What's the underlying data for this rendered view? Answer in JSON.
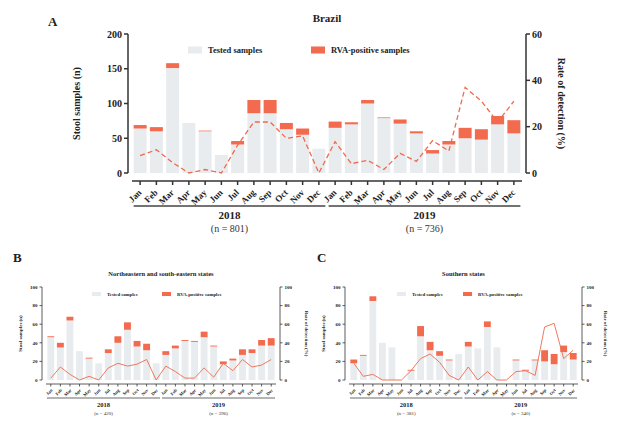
{
  "colors": {
    "tested": "#e9ecef",
    "positive": "#f26b4f",
    "rate_line": "#ee6a4c",
    "axis": "#333333"
  },
  "chart_data": [
    {
      "panel": "A",
      "type": "bar",
      "title": "Brazil",
      "xlabel": "",
      "ylabel": "Stool samples (n)",
      "y2label": "Rate of detection (%)",
      "ylim": [
        0,
        200
      ],
      "y2lim": [
        0,
        60
      ],
      "yticks": [
        0,
        50,
        100,
        150,
        200
      ],
      "y2ticks": [
        0,
        20,
        40,
        60
      ],
      "legend": [
        "Tested samples",
        "RVA-positive samples"
      ],
      "legend_position": "top",
      "grid": false,
      "categories": [
        "Jan",
        "Feb",
        "Mar",
        "Apr",
        "May",
        "Jun",
        "Jul",
        "Aug",
        "Sep",
        "Oct",
        "Nov",
        "Dec",
        "Jan",
        "Feb",
        "Mar",
        "Apr",
        "May",
        "Jun",
        "Jul",
        "Aug",
        "Sep",
        "Oct",
        "Nov",
        "Dec"
      ],
      "groups": [
        {
          "label": "2018",
          "n_label": "(n = 801)"
        },
        {
          "label": "2019",
          "n_label": "(n = 736)"
        }
      ],
      "series": [
        {
          "name": "Tested samples",
          "values": [
            64,
            60,
            151,
            72,
            60,
            26,
            41,
            86,
            86,
            63,
            55,
            35,
            65,
            70,
            100,
            79,
            71,
            57,
            28,
            41,
            50,
            48,
            70,
            57
          ]
        },
        {
          "name": "RVA-positive samples",
          "values": [
            5,
            6,
            7,
            0,
            1,
            0,
            5,
            19,
            19,
            9,
            9,
            0,
            9,
            3,
            5,
            1,
            6,
            3,
            5,
            5,
            15,
            15,
            12,
            19
          ]
        },
        {
          "name": "Rate of detection (%)",
          "axis": "right",
          "values": [
            7.5,
            10,
            4.5,
            0,
            1.5,
            0,
            12,
            22,
            22,
            15,
            16,
            0,
            13.5,
            4,
            5.5,
            1.5,
            8.5,
            5,
            14,
            9.5,
            37,
            31,
            22,
            31
          ]
        }
      ]
    },
    {
      "panel": "B",
      "type": "bar",
      "title": "Northeastern and south-eastern states",
      "ylabel": "Stool samples (n)",
      "y2label": "Rate of detection (%)",
      "ylim": [
        0,
        100
      ],
      "y2lim": [
        0,
        100
      ],
      "yticks": [
        0,
        20,
        40,
        60,
        80,
        100
      ],
      "y2ticks": [
        0,
        20,
        40,
        60,
        80,
        100
      ],
      "legend": [
        "Tested samples",
        "RVA-positive samples"
      ],
      "categories": [
        "Jan",
        "Feb",
        "Mar",
        "Apr",
        "May",
        "Jun",
        "Jul",
        "Aug",
        "Sep",
        "Oct",
        "Nov",
        "Dec",
        "Jan",
        "Feb",
        "Mar",
        "Apr",
        "May",
        "Jun",
        "Jul",
        "Aug",
        "Sep",
        "Oct",
        "Nov",
        "Dec"
      ],
      "groups": [
        {
          "label": "2018",
          "n_label": "(n = 420)"
        },
        {
          "label": "2019",
          "n_label": "(n = 396)"
        }
      ],
      "series": [
        {
          "name": "Tested samples",
          "values": [
            46,
            35,
            64,
            31,
            23,
            18,
            29,
            40,
            54,
            36,
            32,
            18,
            27,
            34,
            42,
            41,
            46,
            36,
            17,
            21,
            27,
            29,
            37,
            37
          ]
        },
        {
          "name": "RVA-positive samples",
          "values": [
            1,
            5,
            4,
            0,
            1,
            0,
            4,
            7,
            8,
            6,
            7,
            0,
            4,
            3,
            1,
            1,
            6,
            1,
            3,
            2,
            6,
            4,
            6,
            8
          ]
        },
        {
          "name": "Rate of detection (%)",
          "axis": "right",
          "values": [
            2,
            14,
            6,
            0,
            4,
            0,
            13,
            18,
            15,
            17,
            22,
            0,
            15,
            9,
            2,
            2,
            13,
            3,
            18,
            10,
            22,
            14,
            16,
            22
          ]
        }
      ]
    },
    {
      "panel": "C",
      "type": "bar",
      "title": "Southern states",
      "ylabel": "Stool samples (n)",
      "y2label": "Rate of detection (%)",
      "ylim": [
        0,
        100
      ],
      "y2lim": [
        0,
        100
      ],
      "yticks": [
        0,
        20,
        40,
        60,
        80,
        100
      ],
      "y2ticks": [
        0,
        20,
        40,
        60,
        80,
        100
      ],
      "legend": [
        "Tested samples",
        "RVA-positive samples"
      ],
      "categories": [
        "Jan",
        "Feb",
        "Mar",
        "Apr",
        "May",
        "Jun",
        "Jul",
        "Aug",
        "Sep",
        "Oct",
        "Nov",
        "Dec",
        "Jan",
        "Feb",
        "Mar",
        "Apr",
        "May",
        "Jun",
        "Jul",
        "Aug",
        "Sep",
        "Oct",
        "Nov",
        "Dec"
      ],
      "groups": [
        {
          "label": "2018",
          "n_label": "(n = 381)"
        },
        {
          "label": "2019",
          "n_label": "(n = 340)"
        }
      ],
      "series": [
        {
          "name": "Tested samples",
          "values": [
            18,
            26,
            85,
            40,
            35,
            0,
            10,
            47,
            32,
            26,
            21,
            28,
            36,
            34,
            57,
            35,
            0,
            21,
            10,
            21,
            20,
            17,
            30,
            22
          ]
        },
        {
          "name": "RVA-positive samples",
          "values": [
            4,
            1,
            5,
            0,
            0,
            0,
            1,
            11,
            9,
            5,
            1,
            0,
            5,
            0,
            6,
            0,
            0,
            1,
            1,
            1,
            12,
            11,
            7,
            7
          ]
        },
        {
          "name": "Rate of detection (%)",
          "axis": "right",
          "values": [
            18,
            4,
            6,
            0,
            0,
            0,
            10,
            23,
            28,
            19,
            5,
            0,
            14,
            0,
            9,
            0,
            0,
            9,
            10,
            5,
            57,
            61,
            23,
            32
          ]
        }
      ]
    }
  ],
  "panels": {
    "A": {
      "letter": "A",
      "title": "Brazil",
      "ylabel": "Stool samples (n)",
      "y2label": "Rate of detection (%)",
      "legend_tested": "Tested samples",
      "legend_positive": "RVA-positive samples",
      "year1": "2018",
      "n1": "(n = 801)",
      "year2": "2019",
      "n2": "(n = 736)"
    },
    "B": {
      "letter": "B",
      "title": "Northeastern and south-eastern states",
      "ylabel": "Stool samples (n)",
      "y2label": "Rate of detection (%)",
      "legend_tested": "Tested samples",
      "legend_positive": "RVA-positive samples",
      "year1": "2018",
      "n1": "(n = 420)",
      "year2": "2019",
      "n2": "(n = 396)"
    },
    "C": {
      "letter": "C",
      "title": "Southern states",
      "ylabel": "Stool samples (n)",
      "y2label": "Rate of detection (%)",
      "legend_tested": "Tested samples",
      "legend_positive": "RVA-positive samples",
      "year1": "2018",
      "n1": "(n = 381)",
      "year2": "2019",
      "n2": "(n = 340)"
    }
  }
}
